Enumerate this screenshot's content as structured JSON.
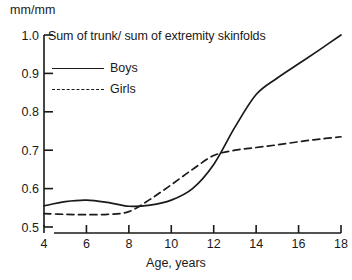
{
  "chart_data": {
    "type": "line",
    "title": "Sum of trunk/ sum of extremity skinfolds",
    "xlabel": "Age, years",
    "ylabel": "mm/mm",
    "xlim": [
      4,
      18
    ],
    "ylim": [
      0.5,
      1.0
    ],
    "xticks": [
      "4",
      "6",
      "8",
      "10",
      "12",
      "14",
      "16",
      "18"
    ],
    "yticks": [
      "1.0",
      "0.9",
      "0.8",
      "0.7",
      "0.6",
      "0.5"
    ],
    "grid": false,
    "legend_position": "top-left-inside",
    "x": [
      4,
      5,
      6,
      7,
      8,
      9,
      10,
      11,
      12,
      13,
      14,
      15,
      16,
      17,
      18
    ],
    "series": [
      {
        "name": "Boys",
        "style": "solid",
        "color": "#1a1a1a",
        "values": [
          0.555,
          0.566,
          0.57,
          0.564,
          0.554,
          0.557,
          0.57,
          0.6,
          0.663,
          0.76,
          0.845,
          0.888,
          0.925,
          0.962,
          1.0
        ]
      },
      {
        "name": "Girls",
        "style": "dashed",
        "color": "#1a1a1a",
        "values": [
          0.535,
          0.533,
          0.532,
          0.533,
          0.54,
          0.572,
          0.61,
          0.65,
          0.686,
          0.7,
          0.707,
          0.714,
          0.722,
          0.729,
          0.735
        ]
      }
    ],
    "annotations": [
      "Boys and girls curves cross near age 8.4 at about 0.553",
      "Boys and girls curves cross again near age 12.3 at about 0.690"
    ]
  }
}
